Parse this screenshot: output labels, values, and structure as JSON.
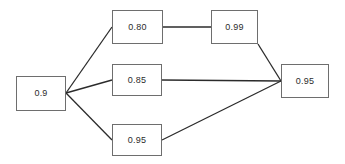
{
  "diagram": {
    "type": "reliability-block-diagram",
    "background_color": "#ffffff",
    "box_border_color": "#6e6e6e",
    "edge_color": "#2b2b2b",
    "text_color": "#2b2b2b",
    "nodes": [
      {
        "id": "source",
        "label": "0.9",
        "x": 16,
        "y": 76,
        "width": 50,
        "height": 35
      },
      {
        "id": "branch-a-1",
        "label": "0.80",
        "x": 112,
        "y": 10,
        "width": 51,
        "height": 34
      },
      {
        "id": "branch-a-2",
        "label": "0.99",
        "x": 211,
        "y": 10,
        "width": 47,
        "height": 34
      },
      {
        "id": "branch-b-1",
        "label": "0.85",
        "x": 112,
        "y": 64,
        "width": 50,
        "height": 32
      },
      {
        "id": "branch-c-1",
        "label": "0.95",
        "x": 112,
        "y": 124,
        "width": 50,
        "height": 32
      },
      {
        "id": "sink",
        "label": "0.95",
        "x": 281,
        "y": 64,
        "width": 48,
        "height": 34
      }
    ],
    "edges": [
      {
        "id": "source-to-branch-a",
        "from": "source",
        "to": "branch-a-1",
        "x1": 66,
        "y1": 93,
        "x2": 112,
        "y2": 27
      },
      {
        "id": "source-to-branch-b",
        "from": "source",
        "to": "branch-b-1",
        "x1": 66,
        "y1": 93,
        "x2": 112,
        "y2": 80
      },
      {
        "id": "source-to-branch-c",
        "from": "source",
        "to": "branch-c-1",
        "x1": 66,
        "y1": 93,
        "x2": 112,
        "y2": 140
      },
      {
        "id": "branch-a-1-to-branch-a-2",
        "from": "branch-a-1",
        "to": "branch-a-2",
        "x1": 163,
        "y1": 27,
        "x2": 211,
        "y2": 27
      },
      {
        "id": "branch-a-2-to-sink",
        "from": "branch-a-2",
        "to": "sink",
        "x1": 258,
        "y1": 44,
        "x2": 281,
        "y2": 81
      },
      {
        "id": "branch-b-1-to-sink",
        "from": "branch-b-1",
        "to": "sink",
        "x1": 162,
        "y1": 80,
        "x2": 281,
        "y2": 81
      },
      {
        "id": "branch-c-1-to-sink",
        "from": "branch-c-1",
        "to": "sink",
        "x1": 162,
        "y1": 140,
        "x2": 281,
        "y2": 81
      }
    ]
  }
}
